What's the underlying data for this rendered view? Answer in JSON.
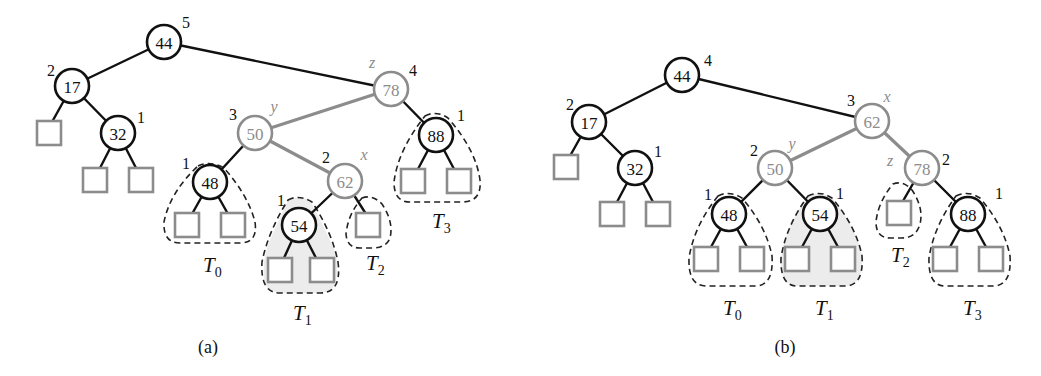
{
  "colors": {
    "black": "#111111",
    "gray": "#8c8c8c",
    "shade": "#ececec"
  },
  "panel_a": {
    "caption": "(a)",
    "nodes": [
      {
        "key": "44",
        "height": "5",
        "role": "",
        "style": "black"
      },
      {
        "key": "17",
        "height": "2",
        "role": "",
        "style": "black"
      },
      {
        "key": "32",
        "height": "1",
        "role": "",
        "style": "black"
      },
      {
        "key": "78",
        "height": "4",
        "role": "z",
        "style": "gray"
      },
      {
        "key": "50",
        "height": "3",
        "role": "y",
        "style": "gray"
      },
      {
        "key": "62",
        "height": "2",
        "role": "x",
        "style": "gray"
      },
      {
        "key": "48",
        "height": "1",
        "role": "",
        "style": "black"
      },
      {
        "key": "54",
        "height": "1",
        "role": "",
        "style": "black"
      },
      {
        "key": "88",
        "height": "1",
        "role": "",
        "style": "black"
      }
    ],
    "subtrees": [
      {
        "name": "T",
        "sub": "0"
      },
      {
        "name": "T",
        "sub": "1"
      },
      {
        "name": "T",
        "sub": "2"
      },
      {
        "name": "T",
        "sub": "3"
      }
    ]
  },
  "panel_b": {
    "caption": "(b)",
    "nodes": [
      {
        "key": "44",
        "height": "4",
        "role": "",
        "style": "black"
      },
      {
        "key": "17",
        "height": "2",
        "role": "",
        "style": "black"
      },
      {
        "key": "32",
        "height": "1",
        "role": "",
        "style": "black"
      },
      {
        "key": "62",
        "height": "3",
        "role": "x",
        "style": "gray"
      },
      {
        "key": "50",
        "height": "2",
        "role": "y",
        "style": "gray"
      },
      {
        "key": "78",
        "height": "2",
        "role": "z",
        "style": "gray"
      },
      {
        "key": "48",
        "height": "1",
        "role": "",
        "style": "black"
      },
      {
        "key": "54",
        "height": "1",
        "role": "",
        "style": "black"
      },
      {
        "key": "88",
        "height": "1",
        "role": "",
        "style": "black"
      }
    ],
    "subtrees": [
      {
        "name": "T",
        "sub": "0"
      },
      {
        "name": "T",
        "sub": "1"
      },
      {
        "name": "T",
        "sub": "2"
      },
      {
        "name": "T",
        "sub": "3"
      }
    ]
  }
}
